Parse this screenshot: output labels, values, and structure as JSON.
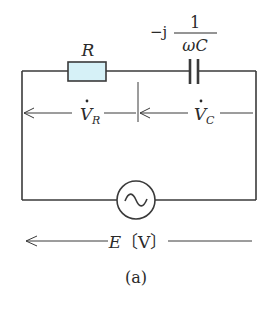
{
  "figure": {
    "caption": "(a)",
    "colors": {
      "wire": "#3a3a3a",
      "resistor_fill": "#d6f1f7",
      "text": "#2a2a2a"
    }
  },
  "components": {
    "resistor": {
      "label": "R"
    },
    "capacitor": {
      "prefix": "−j",
      "numerator": "1",
      "denominator": "ωC"
    },
    "source": {
      "symbol": "~",
      "type": "AC voltage source"
    }
  },
  "voltages": {
    "v_r": {
      "main": "V",
      "sub": "R",
      "dot": "·"
    },
    "v_c": {
      "main": "V",
      "sub": "C",
      "dot": "·"
    },
    "e": {
      "main": "E",
      "unit": "〔V〕"
    }
  }
}
